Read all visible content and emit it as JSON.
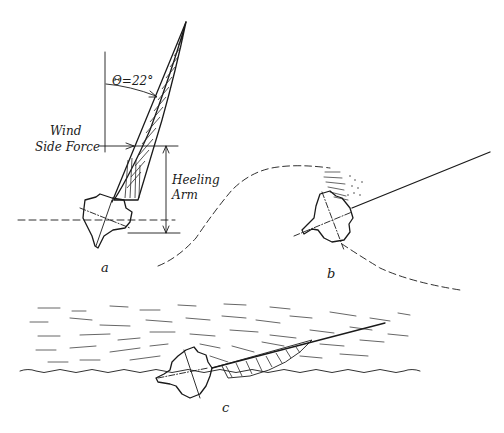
{
  "figure": {
    "ink_color": "#1a1a1a",
    "background": "#ffffff"
  },
  "panel_a": {
    "label": "a",
    "angle_label": "Θ=22°",
    "force_label_line1": "Wind",
    "force_label_line2": "Side Force",
    "arm_label_line1": "Heeling",
    "arm_label_line2": "Arm"
  },
  "panel_b": {
    "label": "b"
  },
  "panel_c": {
    "label": "c"
  }
}
